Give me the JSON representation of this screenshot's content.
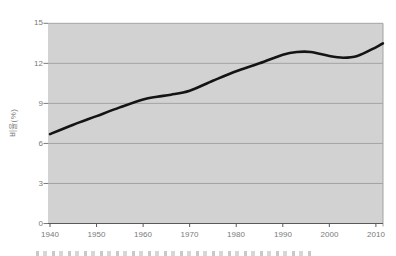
{
  "chart_data": {
    "type": "line",
    "title": "",
    "xlabel": "",
    "ylabel": "비율(%)",
    "x_ticks": [
      1940,
      1950,
      1960,
      1970,
      1980,
      1990,
      2000,
      2010
    ],
    "y_ticks": [
      15,
      12,
      9,
      6,
      3,
      0
    ],
    "xlim": [
      1940,
      2011.5
    ],
    "ylim": [
      0,
      15
    ],
    "grid": "horizontal-only",
    "legend": "none",
    "series": [
      {
        "points": [
          [
            1940,
            6.7
          ],
          [
            1945,
            7.4
          ],
          [
            1950,
            8.05
          ],
          [
            1955,
            8.7
          ],
          [
            1960,
            9.3
          ],
          [
            1963,
            9.5
          ],
          [
            1966,
            9.65
          ],
          [
            1970,
            9.95
          ],
          [
            1975,
            10.7
          ],
          [
            1980,
            11.4
          ],
          [
            1985,
            12.0
          ],
          [
            1990,
            12.65
          ],
          [
            1993,
            12.85
          ],
          [
            1996,
            12.85
          ],
          [
            2000,
            12.55
          ],
          [
            2003,
            12.42
          ],
          [
            2006,
            12.55
          ],
          [
            2010,
            13.2
          ],
          [
            2011.5,
            13.5
          ]
        ],
        "color": "#141414",
        "stroke_width": 2.6
      }
    ],
    "colors": {
      "plot_background": "#d2d2d2",
      "gridline": "#a3a3a3",
      "axis_line": "#595959",
      "tick_label": "#7a7a7a"
    }
  }
}
